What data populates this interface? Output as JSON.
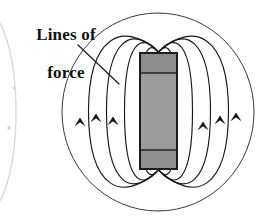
{
  "figure": {
    "background_color": "#ffffff",
    "width": 271,
    "height": 223
  },
  "annotation": {
    "label_text": "Lines of\nforce",
    "label_line1": "Lines of",
    "label_line2": "force",
    "text_color": "#111111",
    "leader_line": {
      "name": "leader-line",
      "from_x": 78,
      "from_y": 45,
      "to_x": 119,
      "to_y": 84,
      "color": "#1a1a1a"
    }
  },
  "magnet": {
    "name": "bar-magnet",
    "x": 140,
    "y": 53,
    "width": 37,
    "height": 116,
    "outline_color": "#1c1c1c",
    "outline_width": 2,
    "segments": [
      {
        "name": "north-pole-cap",
        "y": 53,
        "height": 20,
        "fill": "#8d8d8d"
      },
      {
        "name": "magnet-body",
        "y": 73,
        "height": 77,
        "fill": "#9c9c9c"
      },
      {
        "name": "south-pole-cap",
        "y": 150,
        "height": 19,
        "fill": "#8f8f8f"
      }
    ],
    "divider_color": "#222222"
  },
  "field": {
    "line_color": "#1a1a1a",
    "line_width": 1.15,
    "arrow_color": "#111111",
    "arrow_direction": "up",
    "arrow_count_left": 3,
    "arrow_count_right": 3,
    "closed_loop_count": 4,
    "outer_oval": {
      "name": "outer-field-oval",
      "cx": 158,
      "cy": 112,
      "rx": 96,
      "ry": 99,
      "line_width": 1.0,
      "color": "#3a3a3a"
    },
    "loops": [
      {
        "name": "field-loop-1",
        "half_width": 18,
        "top_y": 40,
        "bottom_y": 182
      },
      {
        "name": "field-loop-2",
        "half_width": 34,
        "top_y": 30,
        "bottom_y": 192
      },
      {
        "name": "field-loop-3",
        "half_width": 52,
        "top_y": 23,
        "bottom_y": 199
      },
      {
        "name": "field-loop-4",
        "half_width": 70,
        "top_y": 18,
        "bottom_y": 205
      }
    ],
    "arrows_left": [
      {
        "name": "field-arrow-left-1",
        "x": 80,
        "y": 118
      },
      {
        "name": "field-arrow-left-2",
        "x": 96,
        "y": 114
      },
      {
        "name": "field-arrow-left-3",
        "x": 113,
        "y": 117
      }
    ],
    "arrows_right": [
      {
        "name": "field-arrow-right-1",
        "x": 203,
        "y": 122
      },
      {
        "name": "field-arrow-right-2",
        "x": 220,
        "y": 116
      },
      {
        "name": "field-arrow-right-3",
        "x": 236,
        "y": 113
      }
    ]
  },
  "edge_artifact": {
    "name": "cropped-neighbor-arc",
    "description": "faint partial ellipse from adjacent cropped figure",
    "cx": -14,
    "cy": 112,
    "rx": 30,
    "ry": 100,
    "color": "#d9d9d9"
  }
}
